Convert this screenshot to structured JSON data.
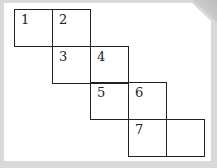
{
  "diagram": {
    "type": "cube-net-staircase",
    "cells": [
      {
        "label": "1",
        "col": 0,
        "row": 0
      },
      {
        "label": "2",
        "col": 1,
        "row": 0
      },
      {
        "label": "3",
        "col": 1,
        "row": 1
      },
      {
        "label": "4",
        "col": 2,
        "row": 1
      },
      {
        "label": "5",
        "col": 2,
        "row": 2
      },
      {
        "label": "6",
        "col": 3,
        "row": 2
      },
      {
        "label": "7",
        "col": 3,
        "row": 3
      },
      {
        "label": "",
        "col": 4,
        "row": 3
      }
    ],
    "line_color": "#222222",
    "background": "#ffffff",
    "frame_color": "#d9d9d9"
  }
}
